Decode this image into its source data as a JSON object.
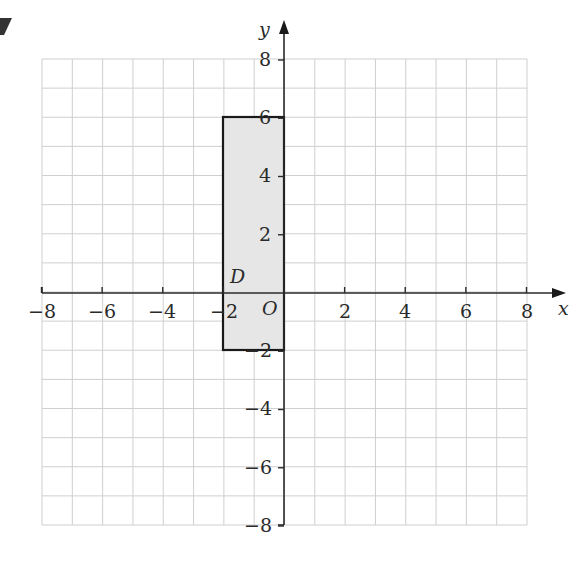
{
  "question_marker": "7",
  "axes": {
    "x_label": "x",
    "y_label": "y",
    "origin_label": "O",
    "x_ticks": [
      "−8",
      "−6",
      "−4",
      "−2",
      "2",
      "4",
      "6",
      "8"
    ],
    "y_ticks": [
      "8",
      "6",
      "4",
      "2",
      "−2",
      "−4",
      "−6",
      "−8"
    ],
    "range": [
      -8,
      8
    ]
  },
  "shape": {
    "label": "D",
    "vertices": [
      [
        -2,
        6
      ],
      [
        0,
        6
      ],
      [
        0,
        -2
      ],
      [
        -2,
        -2
      ]
    ],
    "fill": "#e6e6e6",
    "stroke": "#1a1a1a"
  },
  "chart_data": {
    "type": "diagram",
    "title": "",
    "xlabel": "x",
    "ylabel": "y",
    "xlim": [
      -8,
      8
    ],
    "ylim": [
      -8,
      8
    ],
    "grid": true,
    "shapes": [
      {
        "name": "D",
        "type": "rectangle",
        "vertices": [
          [
            -2,
            6
          ],
          [
            0,
            6
          ],
          [
            0,
            -2
          ],
          [
            -2,
            -2
          ]
        ]
      }
    ]
  }
}
